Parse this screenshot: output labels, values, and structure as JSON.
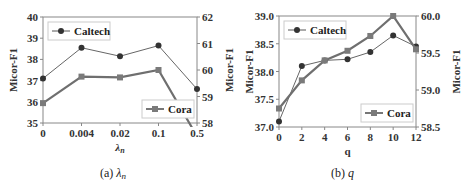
{
  "chart_data": [
    {
      "type": "line",
      "title": "",
      "caption": "(a) λn",
      "caption_prefix": "(a) ",
      "caption_symbol": "λ",
      "caption_sub": "n",
      "xlabel_symbol": "λ",
      "xlabel_sub": "n",
      "categories": [
        "0",
        "0.004",
        "0.02",
        "0.1",
        "0.5"
      ],
      "ylabel_left": "Micor-F1",
      "ylabel_right": "Micor-F1",
      "ylim_left": [
        35,
        40
      ],
      "yticks_left": [
        "35",
        "36",
        "37",
        "38",
        "39",
        "40"
      ],
      "ylim_right": [
        58,
        62
      ],
      "yticks_right": [
        "58",
        "59",
        "60",
        "61",
        "62"
      ],
      "grid": false,
      "series": [
        {
          "name": "Caltech",
          "axis": "left",
          "marker": "circle",
          "color": "#555555",
          "values": [
            37.1,
            38.55,
            38.15,
            38.65,
            36.6
          ]
        },
        {
          "name": "Cora",
          "axis": "right",
          "marker": "square",
          "color": "#777777",
          "values": [
            58.75,
            59.75,
            59.72,
            60.0,
            57.5
          ]
        }
      ],
      "legend": [
        {
          "label": "Caltech",
          "position": "upper-left"
        },
        {
          "label": "Cora",
          "position": "lower-right"
        }
      ]
    },
    {
      "type": "line",
      "title": "",
      "caption": "(b) q",
      "caption_prefix": "(b) ",
      "caption_symbol": "q",
      "xlabel": "q",
      "x": [
        0,
        2,
        4,
        6,
        8,
        10,
        12
      ],
      "xticks": [
        "0",
        "2",
        "4",
        "6",
        "8",
        "10",
        "12"
      ],
      "ylabel_left": "Micor-F1",
      "ylabel_right": "Micor-F1",
      "ylim_left": [
        37.0,
        39.0
      ],
      "yticks_left": [
        "37.0",
        "37.5",
        "38.0",
        "38.5",
        "39.0"
      ],
      "ylim_right": [
        58.5,
        60.0
      ],
      "yticks_right": [
        "58.5",
        "59.0",
        "59.5",
        "60.0"
      ],
      "grid": false,
      "series": [
        {
          "name": "Caltech",
          "axis": "left",
          "marker": "circle",
          "color": "#555555",
          "values": [
            37.1,
            38.1,
            38.2,
            38.22,
            38.35,
            38.65,
            38.45
          ]
        },
        {
          "name": "Cora",
          "axis": "right",
          "marker": "square",
          "color": "#777777",
          "values": [
            58.75,
            59.13,
            59.4,
            59.53,
            59.73,
            60.0,
            59.55
          ]
        }
      ],
      "legend": [
        {
          "label": "Caltech",
          "position": "upper-left"
        },
        {
          "label": "Cora",
          "position": "lower-right"
        }
      ]
    }
  ]
}
